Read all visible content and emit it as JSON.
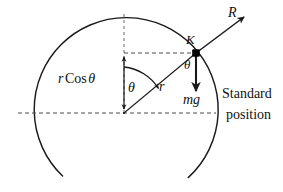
{
  "diagram": {
    "kind": "physics-free-body-diagram",
    "colors": {
      "stroke": "#1a1a1a",
      "dashed": "#555555",
      "point": "#000000",
      "background": "#ffffff"
    },
    "circle": {
      "center_label": "C",
      "center": [
        124,
        113
      ],
      "radius": 92,
      "gap_bottom_degrees": 54,
      "stroke_width": 1.4
    },
    "points": {
      "center": {
        "label": "C",
        "x": 124,
        "y": 113
      },
      "ball": {
        "label": "K",
        "x": 196,
        "y": 53
      }
    },
    "labels": {
      "r_cos_theta": {
        "symbol": "r",
        "function": "Cos",
        "angle": "θ"
      },
      "theta_at_center": "θ",
      "theta_at_ball": "θ",
      "radius": "r",
      "ball": "K",
      "normal_reaction": "R",
      "weight": "mg",
      "reference_line_1": "Standard",
      "reference_line_2": "position"
    },
    "vectors": [
      {
        "name": "normal-reaction",
        "label": "R",
        "from": [
          196,
          53
        ],
        "to": [
          245,
          17
        ],
        "style": "solid-arrow"
      },
      {
        "name": "weight",
        "label": "mg",
        "from": [
          196,
          53
        ],
        "to": [
          196,
          93
        ],
        "style": "solid-arrow"
      },
      {
        "name": "r-cos-theta-measure",
        "label": "r Cos θ",
        "from": [
          124,
          53
        ],
        "to": [
          124,
          113
        ],
        "style": "double-arrow"
      }
    ],
    "dashed_lines": [
      {
        "name": "horizontal-diameter",
        "from": [
          18,
          113
        ],
        "to": [
          216,
          113
        ]
      },
      {
        "name": "vertical-radius",
        "from": [
          124,
          14
        ],
        "to": [
          124,
          113
        ]
      },
      {
        "name": "ball-height-line",
        "from": [
          124,
          53
        ],
        "to": [
          196,
          53
        ]
      }
    ],
    "angle_arc": {
      "name": "theta-sweep",
      "center": [
        124,
        113
      ],
      "from_direction": "vertical-up",
      "to_direction": "radius-to-K",
      "radius": 46,
      "has_arrowhead": true
    }
  }
}
